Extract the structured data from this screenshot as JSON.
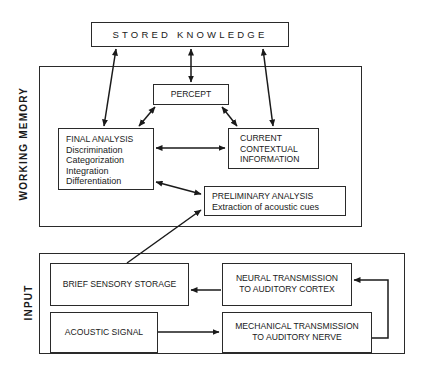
{
  "diagram": {
    "stored_knowledge": "STORED KNOWLEDGE",
    "working_memory": {
      "label": "WORKING MEMORY",
      "percept": "PERCEPT",
      "final_analysis": {
        "title": "FINAL ANALYSIS",
        "items": [
          "Discrimination",
          "Categorization",
          "Integration",
          "Differentiation"
        ]
      },
      "current_context": [
        "CURRENT",
        "CONTEXTUAL",
        "INFORMATION"
      ],
      "preliminary": {
        "title": "PRELIMINARY ANALYSIS",
        "subtitle": "Extraction of acoustic cues"
      }
    },
    "input": {
      "label": "INPUT",
      "brief_sensory": "BRIEF SENSORY STORAGE",
      "neural": [
        "NEURAL TRANSMISSION",
        "TO AUDITORY CORTEX"
      ],
      "acoustic": "ACOUSTIC SIGNAL",
      "mechanical": [
        "MECHANICAL TRANSMISSION",
        "TO AUDITORY NERVE"
      ]
    }
  }
}
